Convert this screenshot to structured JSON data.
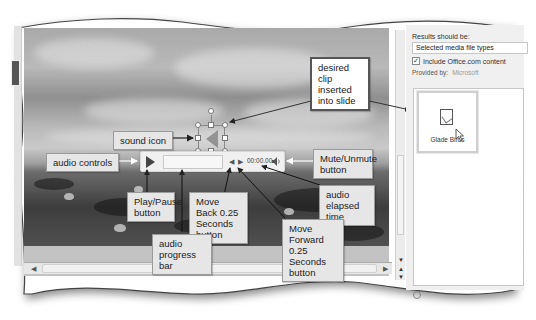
{
  "task_pane": {
    "header_partial": "...ts",
    "results_label": "Results should be:",
    "results_select_value": "Selected media file types",
    "include_office_label": "Include Office.com content",
    "include_office_checked": true,
    "provided_by_label": "Provided by:",
    "provided_by_value": "Microsoft",
    "results": [
      {
        "label": "Glade Birds",
        "icon": "audio-clip-icon",
        "selected": true
      }
    ]
  },
  "audio_player": {
    "elapsed_time": "00:00.00",
    "play_icon": "play-icon",
    "back_icon": "move-back-icon",
    "forward_icon": "move-forward-icon",
    "mute_icon": "speaker-icon"
  },
  "slide": {
    "sound_icon": "speaker-icon",
    "background": "birds on shore under cloudy sky"
  },
  "callouts": {
    "sound_icon": "sound icon",
    "desired_clip": "desired clip inserted into slide",
    "audio_controls": "audio controls",
    "play_pause": "Play/Pause button",
    "move_back": "Move Back 0.25 Seconds button",
    "audio_progress": "audio progress bar",
    "mute_unmute": "Mute/Unmute button",
    "elapsed_time": "audio elapsed time",
    "move_forward": "Move Forward 0.25 Seconds button"
  },
  "colors": {
    "callout_bg": "#e6e6e6",
    "callout_border": "#9a9a9a",
    "pane_bg": "#f0f0f0",
    "slide_gray": "#8f8f8f"
  }
}
